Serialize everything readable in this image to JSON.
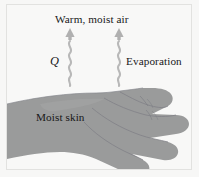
{
  "figure": {
    "background_color": "#f8f8f7",
    "frame_border_color": "#e2e2e0",
    "hand_color": "#9a9b9b",
    "hand_outline_color": "#86878a",
    "arrow_color": "#b5b5b5",
    "text_color": "#171717"
  },
  "labels": {
    "warm_air": "Warm, moist air",
    "heat_symbol": "Q",
    "evaporation": "Evaporation",
    "moist_skin": "Moist skin"
  },
  "icons": {
    "left_arrow": "up-arrow-icon",
    "right_arrow": "up-arrow-icon",
    "left_wavy": "wavy-vapor-icon",
    "right_wavy": "wavy-vapor-icon",
    "hand": "hand-icon"
  }
}
